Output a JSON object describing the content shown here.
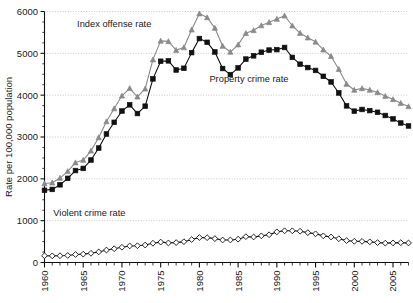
{
  "chart_data": {
    "type": "line",
    "title": "",
    "subtitle": "",
    "xlabel": "",
    "ylabel": "Rate per 100,000  population",
    "xlim": [
      1960,
      2007
    ],
    "ylim": [
      0,
      6000
    ],
    "grid": true,
    "grid_axis": "y",
    "legend_position": "inline-annotations",
    "ytick_labels": [
      "0",
      "1000",
      "2000",
      "3000",
      "4000",
      "5000",
      "6000"
    ],
    "ytick_values": [
      0,
      1000,
      2000,
      3000,
      4000,
      5000,
      6000
    ],
    "xtick_labels": [
      "1960",
      "1965",
      "1970",
      "1975",
      "1980",
      "1985",
      "1990",
      "1995",
      "2000",
      "2005"
    ],
    "xtick_values": [
      1960,
      1965,
      1970,
      1975,
      1980,
      1985,
      1990,
      1995,
      2000,
      2005
    ],
    "x": [
      1960,
      1961,
      1962,
      1963,
      1964,
      1965,
      1966,
      1967,
      1968,
      1969,
      1970,
      1971,
      1972,
      1973,
      1974,
      1975,
      1976,
      1977,
      1978,
      1979,
      1980,
      1981,
      1982,
      1983,
      1984,
      1985,
      1986,
      1987,
      1988,
      1989,
      1990,
      1991,
      1992,
      1993,
      1994,
      1995,
      1996,
      1997,
      1998,
      1999,
      2000,
      2001,
      2002,
      2003,
      2004,
      2005,
      2006,
      2007
    ],
    "series": [
      {
        "name": "Index offense rate",
        "color": "#8a8a8a",
        "marker": "triangle",
        "marker_fill": "#8a8a8a",
        "values": [
          1887,
          1906,
          2019,
          2180,
          2388,
          2449,
          2670,
          2989,
          3370,
          3680,
          3985,
          4164,
          3961,
          4154,
          4850,
          5298,
          5287,
          5077,
          5140,
          5565,
          5950,
          5858,
          5604,
          5175,
          5031,
          5207,
          5480,
          5550,
          5664,
          5741,
          5820,
          5898,
          5660,
          5484,
          5374,
          5275,
          5087,
          4930,
          4620,
          4267,
          4125,
          4163,
          4125,
          4067,
          3977,
          3900,
          3809,
          3730
        ]
      },
      {
        "name": "Property crime rate",
        "color": "#111111",
        "marker": "square",
        "marker_fill": "#111111",
        "values": [
          1726,
          1747,
          1857,
          2012,
          2198,
          2249,
          2450,
          2736,
          3072,
          3351,
          3621,
          3769,
          3561,
          3737,
          4389,
          4811,
          4820,
          4602,
          4643,
          5017,
          5353,
          5264,
          5033,
          4637,
          4492,
          4651,
          4863,
          4940,
          5027,
          5078,
          5089,
          5140,
          4903,
          4740,
          4660,
          4591,
          4451,
          4316,
          4053,
          3744,
          3618,
          3658,
          3631,
          3591,
          3514,
          3432,
          3335,
          3264
        ]
      },
      {
        "name": "Violent crime rate",
        "color": "#111111",
        "marker": "diamond",
        "marker_fill": "#ffffff",
        "values": [
          161,
          159,
          162,
          168,
          191,
          200,
          220,
          253,
          298,
          329,
          364,
          396,
          401,
          417,
          461,
          488,
          468,
          476,
          498,
          548,
          597,
          594,
          571,
          538,
          539,
          557,
          618,
          610,
          637,
          663,
          732,
          758,
          758,
          747,
          714,
          685,
          637,
          611,
          568,
          523,
          507,
          505,
          494,
          476,
          463,
          469,
          474,
          467
        ]
      }
    ],
    "annotations": [
      {
        "text": "Index offense rate",
        "x": 1969.0,
        "y": 5620
      },
      {
        "text": "Property crime rate",
        "x": 1986.4,
        "y": 4320
      },
      {
        "text": "Violent crime rate",
        "x": 1965.8,
        "y": 1110
      }
    ]
  }
}
